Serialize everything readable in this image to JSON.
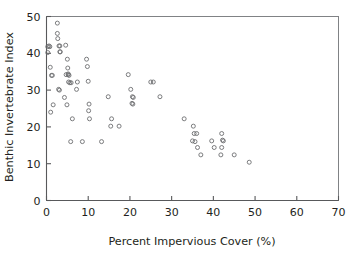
{
  "chart_data": {
    "type": "scatter",
    "title": "",
    "xlabel": "Percent Impervious Cover (%)",
    "ylabel": "Benthic Invertebrate Index",
    "xlim": [
      0,
      70
    ],
    "ylim": [
      0,
      50
    ],
    "xticks": [
      0,
      10,
      20,
      30,
      40,
      50,
      60,
      70
    ],
    "yticks": [
      0,
      10,
      20,
      30,
      40,
      50
    ],
    "xtick_labels": [
      "0",
      "10",
      "20",
      "30",
      "40",
      "50",
      "60",
      "70"
    ],
    "ytick_labels": [
      "0",
      "10",
      "20",
      "30",
      "40",
      "50"
    ],
    "grid": false,
    "legend": null,
    "marker_style": "open-circle",
    "marker_color": "#6d6e71",
    "series": [
      {
        "name": "sites",
        "points": [
          [
            0.3,
            41.8
          ],
          [
            0.3,
            40.2
          ],
          [
            0.6,
            42.0
          ],
          [
            0.8,
            41.8
          ],
          [
            0.9,
            36.2
          ],
          [
            1.2,
            34.0
          ],
          [
            1.4,
            34.0
          ],
          [
            1.0,
            24.0
          ],
          [
            1.6,
            26.0
          ],
          [
            2.6,
            48.2
          ],
          [
            2.6,
            45.4
          ],
          [
            2.7,
            44.0
          ],
          [
            3.0,
            42.0
          ],
          [
            3.2,
            42.0
          ],
          [
            3.2,
            40.4
          ],
          [
            3.3,
            40.4
          ],
          [
            2.9,
            30.2
          ],
          [
            3.1,
            30.0
          ],
          [
            4.6,
            42.2
          ],
          [
            4.7,
            34.2
          ],
          [
            5.2,
            34.2
          ],
          [
            5.4,
            34.0
          ],
          [
            5.3,
            32.2
          ],
          [
            5.6,
            32.0
          ],
          [
            5.9,
            32.0
          ],
          [
            4.3,
            28.0
          ],
          [
            5.0,
            38.4
          ],
          [
            5.1,
            36.0
          ],
          [
            5.2,
            34.4
          ],
          [
            4.9,
            26.0
          ],
          [
            6.2,
            22.2
          ],
          [
            5.8,
            16.0
          ],
          [
            7.4,
            32.2
          ],
          [
            7.2,
            30.2
          ],
          [
            8.6,
            16.0
          ],
          [
            9.6,
            38.4
          ],
          [
            9.8,
            36.4
          ],
          [
            10.0,
            32.4
          ],
          [
            10.2,
            26.2
          ],
          [
            10.1,
            24.4
          ],
          [
            10.3,
            22.2
          ],
          [
            13.2,
            16.0
          ],
          [
            14.8,
            28.2
          ],
          [
            15.6,
            22.2
          ],
          [
            15.4,
            20.2
          ],
          [
            17.4,
            20.2
          ],
          [
            19.6,
            34.2
          ],
          [
            20.2,
            30.2
          ],
          [
            20.6,
            28.2
          ],
          [
            20.8,
            28.0
          ],
          [
            20.5,
            26.4
          ],
          [
            20.7,
            26.2
          ],
          [
            25.0,
            32.2
          ],
          [
            25.6,
            32.2
          ],
          [
            27.2,
            28.2
          ],
          [
            33.0,
            22.2
          ],
          [
            35.2,
            20.2
          ],
          [
            35.4,
            18.2
          ],
          [
            36.0,
            18.2
          ],
          [
            35.0,
            16.2
          ],
          [
            35.6,
            16.0
          ],
          [
            36.2,
            14.4
          ],
          [
            37.0,
            12.4
          ],
          [
            39.6,
            16.2
          ],
          [
            40.2,
            14.4
          ],
          [
            42.0,
            18.2
          ],
          [
            42.2,
            16.4
          ],
          [
            42.4,
            16.2
          ],
          [
            42.0,
            14.4
          ],
          [
            41.8,
            12.4
          ],
          [
            45.0,
            12.4
          ],
          [
            48.6,
            10.4
          ]
        ]
      }
    ]
  },
  "axes": {
    "x_title": "Percent Impervious Cover (%)",
    "y_title": "Benthic Invertebrate Index"
  }
}
